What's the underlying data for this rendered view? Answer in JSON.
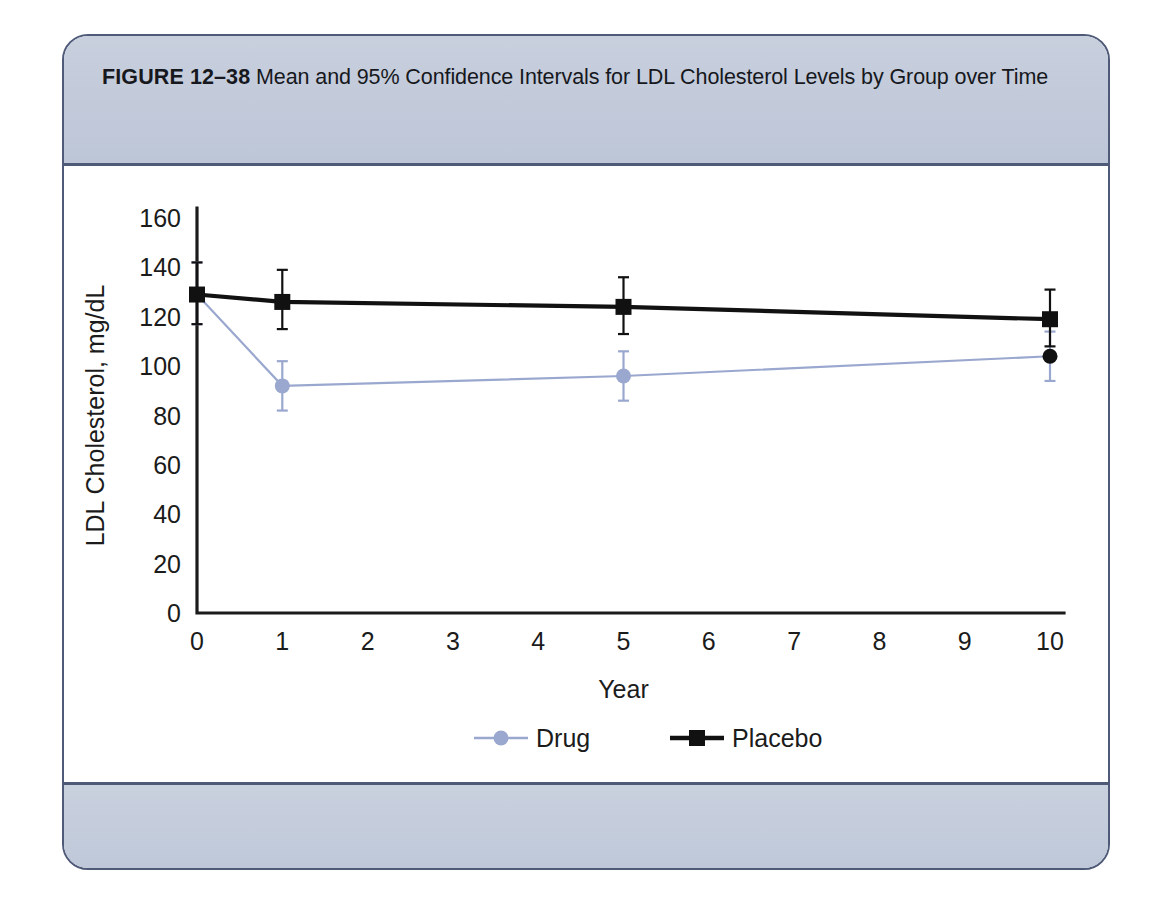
{
  "figure": {
    "label": "FIGURE 12–38",
    "caption": "Mean and 95% Confidence Intervals for LDL Cholesterol Levels by Group over Time",
    "frame_border_color": "#4e5a78",
    "band_color": "#c3ccdb"
  },
  "chart_data": {
    "type": "line",
    "title": "",
    "subtitle": "",
    "xlabel": "Year",
    "ylabel": "LDL Cholesterol, mg/dL",
    "x": [
      0,
      1,
      5,
      10
    ],
    "xlim": [
      0,
      10
    ],
    "ylim": [
      0,
      160
    ],
    "xticks": [
      0,
      1,
      2,
      3,
      4,
      5,
      6,
      7,
      8,
      9,
      10
    ],
    "yticks": [
      0,
      20,
      40,
      60,
      80,
      100,
      120,
      140,
      160
    ],
    "xticklabels": [
      "0",
      "1",
      "2",
      "3",
      "4",
      "5",
      "6",
      "7",
      "8",
      "9",
      "10"
    ],
    "yticklabels": [
      "0",
      "20",
      "40",
      "60",
      "80",
      "100",
      "120",
      "140",
      "160"
    ],
    "grid": false,
    "legend_position": "below-axis",
    "error_bars": "95% confidence interval",
    "series": [
      {
        "name": "Drug",
        "color": "#9aa8cf",
        "marker": "circle",
        "values": [
          129,
          92,
          96,
          104
        ],
        "ci_lower": [
          117,
          82,
          86,
          94
        ],
        "ci_upper": [
          142,
          102,
          106,
          114
        ]
      },
      {
        "name": "Placebo",
        "color": "#111111",
        "marker": "square",
        "values": [
          129,
          126,
          124,
          119
        ],
        "ci_lower": [
          117,
          115,
          113,
          108
        ],
        "ci_upper": [
          142,
          139,
          136,
          131
        ]
      }
    ],
    "legend": [
      {
        "label": "Drug",
        "color": "#9aa8cf",
        "marker": "circle"
      },
      {
        "label": "Placebo",
        "color": "#111111",
        "marker": "square"
      }
    ]
  }
}
